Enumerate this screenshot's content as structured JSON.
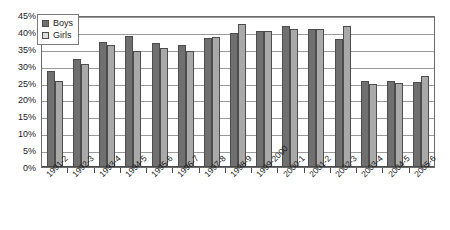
{
  "chart_data": {
    "type": "bar",
    "title": "",
    "xlabel": "",
    "ylabel": "",
    "ylim": [
      0,
      45
    ],
    "ytick_labels": [
      "45%",
      "40%",
      "35%",
      "30%",
      "25%",
      "20%",
      "15%",
      "10%",
      "5%",
      "0%"
    ],
    "ytick_values": [
      45,
      40,
      35,
      30,
      25,
      20,
      15,
      10,
      5,
      0
    ],
    "grid": true,
    "legend_position": "top-left-inside",
    "categories": [
      "1991-2",
      "1992-3",
      "1993-4",
      "1994-5",
      "1995-6",
      "1996-7",
      "1997-8",
      "1998-9",
      "1999-2000",
      "2000-1",
      "2001-2",
      "2002-3",
      "2003-4",
      "2004-5",
      "2005-6"
    ],
    "series": [
      {
        "name": "Boys",
        "color": "#707070",
        "values": [
          28.4,
          32.0,
          37.0,
          38.8,
          36.8,
          36.0,
          38.2,
          39.8,
          40.2,
          41.8,
          40.8,
          37.8,
          25.6,
          25.4,
          25.2
        ]
      },
      {
        "name": "Girls",
        "color": "#a9a9a9",
        "values": [
          25.4,
          30.6,
          36.2,
          34.4,
          35.2,
          34.4,
          38.6,
          42.4,
          40.4,
          41.0,
          41.0,
          41.8,
          24.6,
          24.8,
          27.0
        ]
      }
    ]
  },
  "legend": {
    "entries": [
      {
        "label": "Boys",
        "swatch": "legend-swatch-boys"
      },
      {
        "label": "Girls",
        "swatch": "legend-swatch-girls"
      }
    ]
  }
}
